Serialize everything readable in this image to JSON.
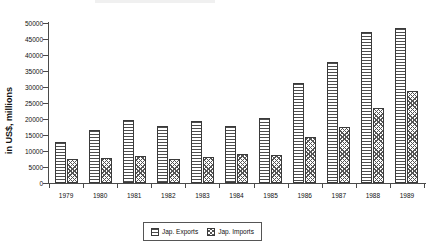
{
  "chart_data": {
    "type": "bar",
    "title": "",
    "subtitle": "",
    "xlabel": "",
    "ylabel": "in US$, millions",
    "categories": [
      "1979",
      "1980",
      "1981",
      "1982",
      "1983",
      "1984",
      "1985",
      "1986",
      "1987",
      "1988",
      "1989"
    ],
    "ylim": [
      0,
      50000
    ],
    "ytick_values": [
      0,
      5000,
      10000,
      15000,
      20000,
      25000,
      30000,
      35000,
      40000,
      45000,
      50000
    ],
    "ytick_labels": [
      "0",
      "5000",
      "10000",
      "15000",
      "20000",
      "25000",
      "30000",
      "35000",
      "40000",
      "45000",
      "50000"
    ],
    "grid": false,
    "legend_position": "bottom-center",
    "series": [
      {
        "name": "Jap. Exports",
        "pattern": "horizontal-lines",
        "values": [
          12700,
          16600,
          19700,
          17800,
          19400,
          17800,
          20300,
          31200,
          37800,
          47300,
          48400
        ]
      },
      {
        "name": "Jap. Imports",
        "pattern": "diagonal-hatch",
        "values": [
          7500,
          7900,
          8300,
          7500,
          8000,
          9200,
          8800,
          14400,
          17600,
          23500,
          28700
        ]
      }
    ]
  },
  "legend": {
    "items": [
      {
        "label": "Jap. Exports"
      },
      {
        "label": "Jap. Imports"
      }
    ]
  },
  "axis": {
    "y_title": "in US$, millions"
  }
}
